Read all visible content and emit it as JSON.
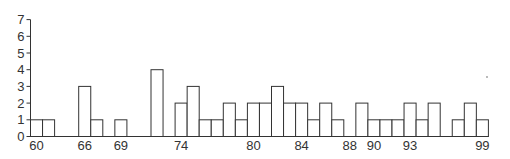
{
  "chart_data": {
    "type": "bar",
    "title": "",
    "xlabel": "",
    "ylabel": "",
    "ylim": [
      0,
      7
    ],
    "yticks": [
      0,
      1,
      2,
      3,
      4,
      5,
      6,
      7
    ],
    "grid": false,
    "legend": null,
    "note": "Histogram-style bars of unit width drawn side by side; slots are consecutive positions along the x-axis. Tick labels appear only under selected slots.",
    "slots": [
      {
        "slot": 0,
        "value": 1
      },
      {
        "slot": 1,
        "value": 1
      },
      {
        "slot": 2,
        "value": 0
      },
      {
        "slot": 3,
        "value": 0
      },
      {
        "slot": 4,
        "value": 3
      },
      {
        "slot": 5,
        "value": 1
      },
      {
        "slot": 6,
        "value": 0
      },
      {
        "slot": 7,
        "value": 1
      },
      {
        "slot": 8,
        "value": 0
      },
      {
        "slot": 9,
        "value": 0
      },
      {
        "slot": 10,
        "value": 4
      },
      {
        "slot": 11,
        "value": 0
      },
      {
        "slot": 12,
        "value": 2
      },
      {
        "slot": 13,
        "value": 3
      },
      {
        "slot": 14,
        "value": 1
      },
      {
        "slot": 15,
        "value": 1
      },
      {
        "slot": 16,
        "value": 2
      },
      {
        "slot": 17,
        "value": 1
      },
      {
        "slot": 18,
        "value": 2
      },
      {
        "slot": 19,
        "value": 2
      },
      {
        "slot": 20,
        "value": 3
      },
      {
        "slot": 21,
        "value": 2
      },
      {
        "slot": 22,
        "value": 2
      },
      {
        "slot": 23,
        "value": 1
      },
      {
        "slot": 24,
        "value": 2
      },
      {
        "slot": 25,
        "value": 1
      },
      {
        "slot": 26,
        "value": 0
      },
      {
        "slot": 27,
        "value": 2
      },
      {
        "slot": 28,
        "value": 1
      },
      {
        "slot": 29,
        "value": 1
      },
      {
        "slot": 30,
        "value": 1
      },
      {
        "slot": 31,
        "value": 2
      },
      {
        "slot": 32,
        "value": 1
      },
      {
        "slot": 33,
        "value": 2
      },
      {
        "slot": 34,
        "value": 0
      },
      {
        "slot": 35,
        "value": 1
      },
      {
        "slot": 36,
        "value": 2
      },
      {
        "slot": 37,
        "value": 1
      }
    ],
    "categories": [
      "60",
      "61",
      "",
      "",
      "66",
      "67",
      "",
      "69",
      "",
      "",
      "72",
      "",
      "74",
      "75",
      "76",
      "77",
      "78",
      "79",
      "80",
      "81",
      "82",
      "83",
      "84",
      "85",
      "86",
      "87",
      "88",
      "89",
      "90",
      "91",
      "92",
      "93",
      "94",
      "95",
      "96",
      "97",
      "98",
      "99"
    ],
    "values": [
      1,
      1,
      0,
      0,
      3,
      1,
      0,
      1,
      0,
      0,
      4,
      0,
      2,
      3,
      1,
      1,
      2,
      1,
      2,
      2,
      3,
      2,
      2,
      1,
      2,
      1,
      0,
      2,
      1,
      1,
      1,
      2,
      1,
      2,
      0,
      1,
      2,
      1
    ],
    "xtick_labels": [
      {
        "label": "60",
        "slot": 0
      },
      {
        "label": "66",
        "slot": 4
      },
      {
        "label": "69",
        "slot": 7
      },
      {
        "label": "74",
        "slot": 12
      },
      {
        "label": "80",
        "slot": 18
      },
      {
        "label": "84",
        "slot": 22
      },
      {
        "label": "88",
        "slot": 26
      },
      {
        "label": "90",
        "slot": 28
      },
      {
        "label": "93",
        "slot": 31
      },
      {
        "label": "99",
        "slot": 37
      }
    ],
    "colors": {
      "bar_fill": "#ffffff",
      "bar_stroke": "#333333",
      "axis": "#333333",
      "text": "#333333"
    }
  }
}
